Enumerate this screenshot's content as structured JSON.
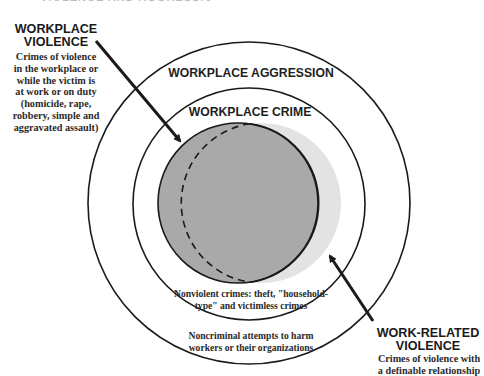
{
  "header": {
    "cut_off_title": "VIOLENCE AND AGGRESSION"
  },
  "left_callout": {
    "title_lines": [
      "WORKPLACE",
      "VIOLENCE"
    ],
    "description_lines": [
      "Crimes of violence",
      "in the workplace or",
      "while the victim is",
      "at work or on duty",
      "(homicide, rape,",
      "robbery, simple and",
      "aggravated assault)"
    ]
  },
  "right_callout": {
    "title_lines": [
      "WORK-RELATED",
      "VIOLENCE"
    ],
    "description_lines": [
      "Crimes of violence with",
      "a definable relationship"
    ]
  },
  "circles": {
    "outer_label": "WORKPLACE AGGRESSION",
    "middle_label": "WORKPLACE CRIME",
    "middle_ring_text_lines": [
      "Nonviolent crimes: theft, \"household-",
      "type\" and victimless crimes"
    ],
    "outer_ring_text_lines": [
      "Noncriminal attempts to harm",
      "workers or their organizations"
    ]
  },
  "colors": {
    "line": "#1a1a1a",
    "workplace_violence_fill": "#a9a9a9",
    "work_related_violence_fill": "#e3e3e3",
    "background": "#ffffff"
  }
}
